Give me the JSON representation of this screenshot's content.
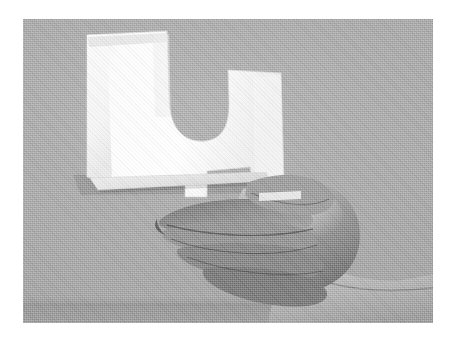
{
  "image": {
    "kind": "photograph",
    "rendering": "grayscale halftone scan",
    "caption": "A hand holding a sheet of white paper cut into the shape of the Greek letter mu",
    "border_color": "#ffffff",
    "frame": {
      "left": 23,
      "top": 19,
      "width": 410,
      "height": 304
    }
  },
  "scene": {
    "background": {
      "name": "plain gray wall",
      "color": "#a9a9a9",
      "highlight_color": "#b2b2b2",
      "shadow_color": "#9e9e9e"
    },
    "surface": {
      "name": "table edge band",
      "color": "#999999",
      "top": 285,
      "height": 19
    },
    "paper": {
      "name": "paper cutout",
      "glyph": "μ",
      "glyph_name": "mu",
      "fill_color": "#fbfbfb",
      "shade_color": "#e2e2e2",
      "edge_color": "#cfcfcf",
      "fold_note": "slight crease along the top-left edge",
      "bottom_flap_color": "#e8e8e8"
    },
    "hand": {
      "name": "right hand",
      "pose": "fingers curled, pinching the paper between thumb and index finger",
      "skin_midtone": "#909090",
      "skin_highlight": "#bdbdbd",
      "skin_shadow": "#5e5e5e",
      "forearm_color": "#b0b0b0",
      "direction": "fingers point left, wrist exits the right edge of the frame"
    }
  },
  "annotations": {
    "alt_text": "Grayscale photo: a hand holds up a white paper cut in the shape of the Greek letter mu against a gray wall."
  }
}
